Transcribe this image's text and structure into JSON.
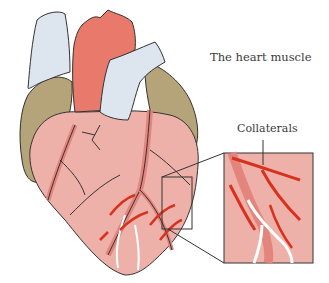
{
  "figure": {
    "title": "The heart muscle",
    "callout_label": "Collaterals",
    "colors": {
      "aorta": "#e8796b",
      "vena_cava": "#dde6ee",
      "atrium": "#b5a47a",
      "myocardium": "#eeb1aa",
      "artery": "#e3857c",
      "collateral": "#d8321f",
      "outline": "#333333",
      "background": "#ffffff"
    }
  }
}
